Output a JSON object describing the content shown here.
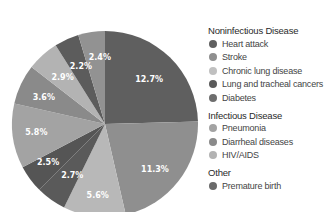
{
  "chart_data": {
    "type": "pie",
    "title": "",
    "unit": "%",
    "start": "12 o'clock",
    "direction": "clockwise",
    "slices": [
      {
        "label": "12.7%",
        "value": 12.7,
        "color": "#5f5f5f"
      },
      {
        "label": "11.3%",
        "value": 11.3,
        "color": "#8f8f8f"
      },
      {
        "label": "5.6%",
        "value": 5.6,
        "color": "#b8b8b8"
      },
      {
        "label": "2.7%",
        "value": 2.7,
        "color": "#5a5a5a"
      },
      {
        "label": "2.5%",
        "value": 2.5,
        "color": "#555555"
      },
      {
        "label": "5.8%",
        "value": 5.8,
        "color": "#a3a3a3"
      },
      {
        "label": "3.6%",
        "value": 3.6,
        "color": "#8a8a8a"
      },
      {
        "label": "2.9%",
        "value": 2.9,
        "color": "#b3b3b3"
      },
      {
        "label": "2.2%",
        "value": 2.2,
        "color": "#5c5c5c"
      },
      {
        "label": "2.4%",
        "value": 2.4,
        "color": "#929292"
      }
    ],
    "legend_placement": "right",
    "legend": [
      {
        "group": "Noninfectious Disease",
        "items": [
          {
            "label": "Heart attack",
            "color": "#5f5f5f"
          },
          {
            "label": "Stroke",
            "color": "#8f8f8f"
          },
          {
            "label": "Chronic lung disease",
            "color": "#c0c0c0"
          },
          {
            "label": "Lung and tracheal cancers",
            "color": "#5a5a5a"
          },
          {
            "label": "Diabetes",
            "color": "#6e6e6e"
          }
        ]
      },
      {
        "group": "Infectious Disease",
        "items": [
          {
            "label": "Pneumonia",
            "color": "#a3a3a3"
          },
          {
            "label": "Diarrheal diseases",
            "color": "#8a8a8a"
          },
          {
            "label": "HIV/AIDS",
            "color": "#b3b3b3"
          }
        ]
      },
      {
        "group": "Other",
        "items": [
          {
            "label": "Premature birth",
            "color": "#6a6a6a"
          }
        ]
      }
    ]
  }
}
